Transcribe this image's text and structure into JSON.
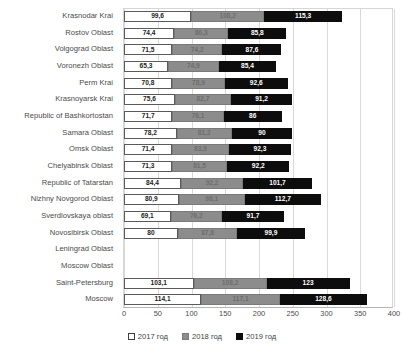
{
  "chart_data": {
    "type": "bar",
    "orientation": "horizontal",
    "stacked": true,
    "title": "",
    "subtitle": "",
    "xlabel": "",
    "ylabel": "",
    "xlim": [
      0,
      400
    ],
    "xticks": [
      0,
      50,
      100,
      150,
      200,
      250,
      300,
      350,
      400
    ],
    "grid": true,
    "legend_position": "bottom",
    "categories": [
      "Krasnodar Krai",
      "Rostov Oblast",
      "Volgograd Oblast",
      "Voronezh Oblast",
      "Perm Krai",
      "Krasnoyarsk Krai",
      "Republic of Bashkortostan",
      "Samara Oblast",
      "Omsk Oblast",
      "Chelyabinsk Oblast",
      "Republic of Tatarstan",
      "Nizhny Novgorod Oblast",
      "Sverdlovskaya oblast",
      "Novosibirsk Oblast",
      "Leningrad Oblast",
      "Moscow Oblast",
      "Saint-Petersburg",
      "Moscow"
    ],
    "series": [
      {
        "name": "2017 год",
        "color": "#ffffff",
        "values": [
          99.6,
          74.4,
          71.5,
          65.3,
          70.8,
          75.6,
          71.7,
          78.2,
          71.4,
          71.3,
          84.4,
          80.9,
          69.1,
          80,
          null,
          null,
          103.1,
          114.1
        ],
        "labels": [
          "99,6",
          "74,4",
          "71,5",
          "65,3",
          "70,8",
          "75,6",
          "71,7",
          "78,2",
          "71,4",
          "71,3",
          "84,4",
          "80,9",
          "69,1",
          "80",
          "",
          "",
          "103,1",
          "114,1"
        ]
      },
      {
        "name": "2018 год",
        "color": "#8c8c8c",
        "values": [
          108.2,
          80.3,
          74.2,
          74.9,
          78.9,
          82.7,
          76.1,
          81.2,
          83.9,
          81.5,
          92.2,
          98.1,
          76.2,
          87.8,
          null,
          null,
          108.2,
          117.1
        ],
        "labels": [
          "108,2",
          "80,3",
          "74,2",
          "74,9",
          "78,9",
          "82,7",
          "76,1",
          "81,2",
          "83,9",
          "81,5",
          "92,2",
          "98,1",
          "76,2",
          "87,8",
          "",
          "",
          "108,2",
          "117,1"
        ]
      },
      {
        "name": "2019 год",
        "color": "#0d0d0d",
        "values": [
          115.3,
          85.8,
          87.6,
          85.4,
          92.6,
          91.2,
          86,
          90,
          92.3,
          92.2,
          101.7,
          112.7,
          91.7,
          99.9,
          null,
          null,
          123,
          128.6
        ],
        "labels": [
          "115,3",
          "85,8",
          "87,6",
          "85,4",
          "92,6",
          "91,2",
          "86",
          "90",
          "92,3",
          "92,2",
          "101,7",
          "112,7",
          "91,7",
          "99,9",
          "",
          "",
          "123",
          "128,6"
        ]
      }
    ]
  }
}
